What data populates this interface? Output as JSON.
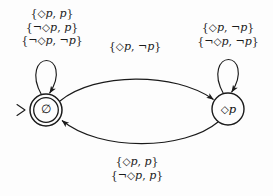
{
  "diagram": {
    "type": "buchi-automaton-state-diagram",
    "title": "",
    "background_color": "#fdfdfd",
    "stroke_color": "#1a1a1a",
    "states": [
      {
        "id": "empty",
        "label": "∅",
        "shape": "double-circle",
        "accepting": true,
        "initial": true,
        "cx": 46,
        "cy": 110,
        "r_outer": 16,
        "r_inner": 12.5
      },
      {
        "id": "diamond_p",
        "label": "◇p",
        "shape": "circle",
        "accepting": false,
        "initial": false,
        "cx": 228,
        "cy": 109,
        "r_outer": 16,
        "r_inner": 16
      }
    ],
    "start_marker": {
      "name": "start-arrow",
      "glyph": ">",
      "x": 22,
      "y": 110
    },
    "transitions": [
      {
        "id": "self-loop-empty",
        "from": "empty",
        "to": "empty",
        "kind": "self-loop",
        "label_lines": [
          "{◇p, p}",
          "{¬◇p, p}",
          "{¬◇p, ¬p}"
        ]
      },
      {
        "id": "empty-to-diamondp",
        "from": "empty",
        "to": "diamond_p",
        "kind": "curve-top",
        "label_lines": [
          "{◇p, ¬p}"
        ]
      },
      {
        "id": "self-loop-diamondp",
        "from": "diamond_p",
        "to": "diamond_p",
        "kind": "self-loop",
        "label_lines": [
          "{◇p, ¬p}",
          "{¬◇p, ¬p}"
        ]
      },
      {
        "id": "diamondp-to-empty",
        "from": "diamond_p",
        "to": "empty",
        "kind": "curve-bottom",
        "label_lines": [
          "{◇p, p}",
          "{¬◇p, p}"
        ]
      }
    ]
  },
  "labels": {
    "top_left": {
      "line1": "{◇p, p}",
      "line2": "{¬◇p, p}",
      "line3": "{¬◇p, ¬p}"
    },
    "top_middle": {
      "line1": "{◇p, ¬p}"
    },
    "top_right": {
      "line1": "{◇p, ¬p}",
      "line2": "{¬◇p, ¬p}"
    },
    "bottom_middle": {
      "line1": "{◇p, p}",
      "line2": "{¬◇p, p}"
    }
  },
  "nodes": {
    "left_label": "∅",
    "right_label": "◇p",
    "start_glyph": ">"
  }
}
